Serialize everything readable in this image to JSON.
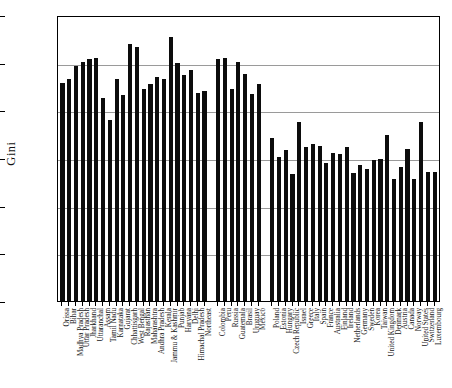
{
  "chart_data": {
    "type": "bar",
    "title": "",
    "xlabel": "",
    "ylabel": "Gini",
    "ylim": [
      0.0,
      0.6
    ],
    "ytick_labels": [
      "0.0",
      "0.1",
      "0.2",
      "0.3",
      "0.4",
      "0.5",
      "0.6"
    ],
    "ytick_values": [
      0.0,
      0.1,
      0.2,
      0.3,
      0.4,
      0.5,
      0.6
    ],
    "grid": "horizontal",
    "legend": "none",
    "bar_color": "#0c0c0c",
    "groups": [
      {
        "name": "Indian states",
        "categories": [
          "Orissa",
          "Bihar",
          "Madhya Pradesh",
          "Uttar Pradesh",
          "Jharkhand",
          "Uttaranchal",
          "Assam",
          "Tamil Nadu",
          "Karnataka",
          "Gujarat",
          "Chhattisgarh",
          "West Bengal",
          "Rajasthan",
          "Maharashtra",
          "Andhra Pradesh",
          "Kerala",
          "Jammu & Kashmir",
          "Punjab",
          "Haryana",
          "Delhi",
          "Himachal Pradesh",
          "Northeast"
        ],
        "values": [
          0.458,
          0.465,
          0.492,
          0.501,
          0.508,
          0.51,
          0.425,
          0.38,
          0.466,
          0.432,
          0.54,
          0.533,
          0.445,
          0.455,
          0.47,
          0.466,
          0.553,
          0.499,
          0.474,
          0.484,
          0.436,
          0.44
        ]
      },
      {
        "name": "Latin America",
        "categories": [
          "Colombia",
          "Peru",
          "Russia",
          "Guatemala",
          "Brasil",
          "Uruguay",
          "Mexico"
        ],
        "values": [
          0.508,
          0.509,
          0.444,
          0.501,
          0.477,
          0.435,
          0.456
        ]
      },
      {
        "name": "Developed and transition economies",
        "categories": [
          "Poland",
          "Estonia",
          "Hungary",
          "Czech Republic",
          "Israel",
          "Greece",
          "Italy",
          "Spain",
          "France",
          "Australia",
          "Finland",
          "Ireland",
          "Netherlands",
          "Germany",
          "Sweden",
          "Korea",
          "Taiwan",
          "United Kingdom",
          "Denmark",
          "Austria",
          "Canada",
          "Norway",
          "United States",
          "Switzerland",
          "Luxembourg"
        ],
        "values": [
          0.342,
          0.302,
          0.316,
          0.266,
          0.376,
          0.323,
          0.329,
          0.325,
          0.289,
          0.311,
          0.308,
          0.324,
          0.268,
          0.286,
          0.276,
          0.296,
          0.298,
          0.348,
          0.256,
          0.282,
          0.318,
          0.256,
          0.376,
          0.271,
          0.271
        ]
      }
    ]
  }
}
